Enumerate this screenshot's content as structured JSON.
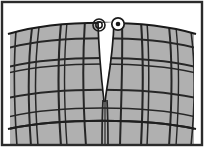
{
  "figure": {
    "title": "Plaid trousers front view with fly opening",
    "style": "line-illustration-grayscale",
    "width": 204,
    "height": 147
  },
  "colors": {
    "background": "#ffffff",
    "fabric_fill": "#b0b0b0",
    "plaid_line": "#262626",
    "outline": "#1a1a1a",
    "frame_border": "#2b2b2b",
    "fly_gap": "#ffffff",
    "button_face": "#ffffff",
    "button_center": "#1a1a1a",
    "buttonhole_stroke": "#1a1a1a"
  },
  "parts": {
    "fabric_label": "Plaid fabric panel",
    "waistband_label": "Waistband top edge",
    "fly_label": "Fly opening",
    "button_label": "Waist button",
    "buttonhole_label": "Buttonhole",
    "left_leg_label": "Left front panel",
    "right_leg_label": "Right front panel",
    "hem_curve_label": "Lower curved seam"
  },
  "geometry": {
    "frame": {
      "x": 2,
      "y": 2,
      "w": 200,
      "h": 143
    },
    "waist_curve": "M 12,31 C 60,18 144,18 192,31",
    "bottom_curve": "M 12,128 C 60,140 144,140 192,128",
    "fly_gap_path": "M 99,22 L 113,22 L 107,72 L 105,101 L 103,101 L 101,72 Z",
    "fly_seam_left": "M 100,24 C 99,60 103,86 104,102",
    "fly_seam_right": "M 112,24 C 113,58 108,84 105,102",
    "center_seam": "M 104,101 L 104,145",
    "button": {
      "cx": 118,
      "cy": 24,
      "r_outer": 6.2,
      "r_inner": 2.3
    },
    "buttonhole": {
      "cx": 99,
      "cy": 25,
      "r_outer": 6.0,
      "r_inner": 3.2
    },
    "vertical_lines": [
      {
        "name": "v1",
        "d": "M 16,33 C 14,70 15,104 18,144"
      },
      {
        "name": "v2",
        "d": "M 31,31 C 27,68 28,104 31,144"
      },
      {
        "name": "v3",
        "d": "M 38,30 C 34,68 35,104 38,144"
      },
      {
        "name": "v4",
        "d": "M 60,26 C 57,66 58,104 61,144"
      },
      {
        "name": "v5",
        "d": "M 66,25 C 63,66 64,104 67,144"
      },
      {
        "name": "v6",
        "d": "M 84,23 C 82,64 83,104 86,144"
      },
      {
        "name": "v7",
        "d": "M 121,23 C 122,64 121,104 120,144"
      },
      {
        "name": "v8",
        "d": "M 140,24 C 143,64 143,104 141,144"
      },
      {
        "name": "v9",
        "d": "M 146,25 C 149,64 149,104 147,144"
      },
      {
        "name": "v10",
        "d": "M 168,28 C 172,66 172,104 169,144"
      },
      {
        "name": "v11",
        "d": "M 174,29 C 178,66 178,104 175,144"
      },
      {
        "name": "v12",
        "d": "M 190,33 C 195,70 194,106 190,144"
      }
    ],
    "horizontal_lines": [
      {
        "name": "h1",
        "d": "M 12,47 C 58,35 146,35 192,47"
      },
      {
        "name": "h2",
        "d": "M 12,66 C 58,55 146,55 192,66"
      },
      {
        "name": "h3",
        "d": "M 12,72 C 58,61 146,61 192,72"
      },
      {
        "name": "h4",
        "d": "M 12,97 C 58,87 146,87 192,97"
      },
      {
        "name": "h5",
        "d": "M 12,116 C 58,105 146,105 192,116"
      },
      {
        "name": "h6",
        "d": "M 12,128 C 58,118 146,118 192,128"
      }
    ]
  }
}
